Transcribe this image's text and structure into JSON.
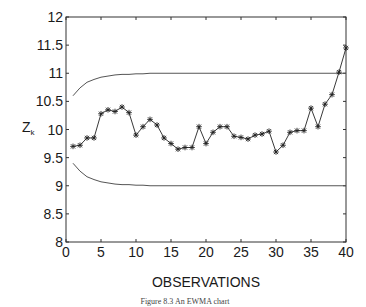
{
  "chart_data": {
    "type": "line",
    "title": "",
    "xlabel": "OBSERVATIONS",
    "ylabel": "Z_k",
    "xlim": [
      0,
      40
    ],
    "ylim": [
      8,
      12
    ],
    "grid": false,
    "legend": null,
    "x_ticks": [
      0,
      5,
      10,
      15,
      20,
      25,
      30,
      35,
      40
    ],
    "y_ticks": [
      8,
      8.5,
      9,
      9.5,
      10,
      10.5,
      11,
      11.5,
      12
    ],
    "x_tick_labels": [
      "0",
      "5",
      "10",
      "15",
      "20",
      "25",
      "30",
      "35",
      "40"
    ],
    "y_tick_labels": [
      "8",
      "8.5",
      "9",
      "9.5",
      "10",
      "10.5",
      "11",
      "11.5",
      "12"
    ],
    "x": [
      1,
      2,
      3,
      4,
      5,
      6,
      7,
      8,
      9,
      10,
      11,
      12,
      13,
      14,
      15,
      16,
      17,
      18,
      19,
      20,
      21,
      22,
      23,
      24,
      25,
      26,
      27,
      28,
      29,
      30,
      31,
      32,
      33,
      34,
      35,
      36,
      37,
      38,
      39,
      40
    ],
    "series": [
      {
        "name": "Z_k",
        "marker": "asterisk",
        "values": [
          9.7,
          9.72,
          9.85,
          9.85,
          10.28,
          10.35,
          10.32,
          10.4,
          10.3,
          9.9,
          10.05,
          10.18,
          10.08,
          9.85,
          9.75,
          9.65,
          9.68,
          9.68,
          10.05,
          9.75,
          9.95,
          10.05,
          10.05,
          9.88,
          9.86,
          9.83,
          9.9,
          9.92,
          9.97,
          9.6,
          9.72,
          9.95,
          9.98,
          9.98,
          10.38,
          10.05,
          10.45,
          10.62,
          11.02,
          11.45
        ]
      },
      {
        "name": "Upper control limit",
        "marker": "none",
        "values": [
          10.6,
          10.74,
          10.84,
          10.89,
          10.93,
          10.95,
          10.97,
          10.98,
          10.98,
          10.99,
          10.99,
          11.0,
          11.0,
          11.0,
          11.0,
          11.0,
          11.0,
          11.0,
          11.0,
          11.0,
          11.0,
          11.0,
          11.0,
          11.0,
          11.0,
          11.0,
          11.0,
          11.0,
          11.0,
          11.0,
          11.0,
          11.0,
          11.0,
          11.0,
          11.0,
          11.0,
          11.0,
          11.0,
          11.0,
          11.0
        ]
      },
      {
        "name": "Lower control limit",
        "marker": "none",
        "values": [
          9.4,
          9.26,
          9.16,
          9.11,
          9.07,
          9.05,
          9.03,
          9.02,
          9.02,
          9.01,
          9.01,
          9.0,
          9.0,
          9.0,
          9.0,
          9.0,
          9.0,
          9.0,
          9.0,
          9.0,
          9.0,
          9.0,
          9.0,
          9.0,
          9.0,
          9.0,
          9.0,
          9.0,
          9.0,
          9.0,
          9.0,
          9.0,
          9.0,
          9.0,
          9.0,
          9.0,
          9.0,
          9.0,
          9.0,
          9.0
        ]
      }
    ],
    "caption": "Figure 8.3 ... EWMA chart"
  },
  "labels": {
    "ylabel_main": "Z",
    "ylabel_sub": "k",
    "xlabel": "OBSERVATIONS",
    "caption": "Figure 8.3  An EWMA chart"
  },
  "colors": {
    "axis": "#333333",
    "series": "#222222",
    "limits": "#555555"
  }
}
